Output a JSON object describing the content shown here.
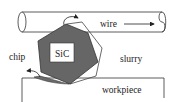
{
  "diagram": {
    "labels": {
      "wire": "wire",
      "sic": "SiC",
      "chip": "chip",
      "slurry": "slurry",
      "workpiece": "workpiece"
    },
    "colors": {
      "background": "#ffffff",
      "line": "#333333",
      "particle_fill": "#666666",
      "particle_outline": "#444444",
      "label_box": "#ffffff",
      "chip_fill": "#6a6a6a"
    },
    "icons": {
      "wire_direction": "arrow-right-icon",
      "rotation": "curved-arrow-icon",
      "chip_ejection": "curved-arrow-left-icon"
    }
  }
}
